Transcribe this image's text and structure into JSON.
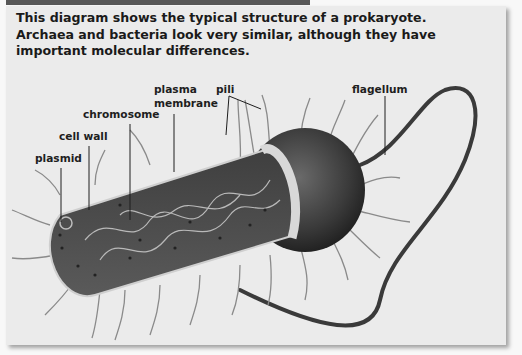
{
  "caption": {
    "lines": [
      "This diagram shows the typical structure of a prokaryote.",
      "Archaea and bacteria look very similar, although they have",
      "important molecular differences."
    ]
  },
  "labels": {
    "plasmid": "plasmid",
    "cell_wall": "cell wall",
    "chromosome": "chromosome",
    "plasma_membrane_line1": "plasma",
    "plasma_membrane_line2": "membrane",
    "pili": "pili",
    "flagellum": "flagellum"
  },
  "colors": {
    "panel_bg": "#ebebeb",
    "page_bg": "#f8f8f8",
    "header_bar": "#575757",
    "cell_body": "#4a4a4a",
    "label_text": "#1e1e1e"
  }
}
